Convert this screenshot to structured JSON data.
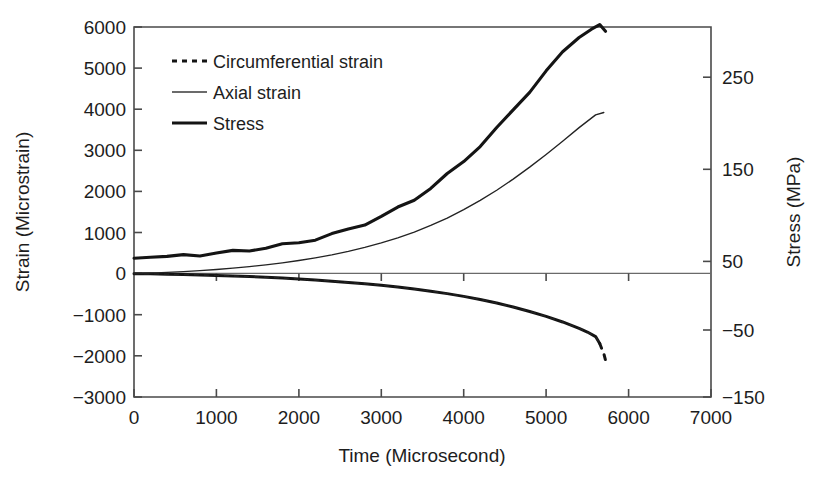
{
  "chart_data": {
    "type": "line",
    "title": "",
    "xlabel": "Time (Microsecond)",
    "ylabel": "Strain (Microstrain)",
    "y2label": "Stress (MPa)",
    "xlim": [
      0,
      7000
    ],
    "ylim": [
      -3000,
      6000
    ],
    "y2lim": [
      -150,
      250
    ],
    "grid": false,
    "legend_position": "top-left inside axes",
    "x_ticks": [
      0,
      1000,
      2000,
      3000,
      4000,
      5000,
      6000,
      7000
    ],
    "x_tick_labels": [
      "0",
      "1000",
      "2000",
      "3000",
      "4000",
      "5000",
      "6000",
      "7000"
    ],
    "y_ticks": [
      -3000,
      -2000,
      -1000,
      0,
      1000,
      2000,
      3000,
      4000,
      5000,
      6000
    ],
    "y_tick_labels": [
      "−3000",
      "−2000",
      "−1000",
      "0",
      "1000",
      "2000",
      "3000",
      "4000",
      "5000",
      "6000"
    ],
    "y2_ticks": [
      -150,
      -50,
      50,
      150,
      250
    ],
    "y2_tick_labels": [
      "−150",
      "−50",
      "50",
      "150",
      "250"
    ],
    "series": [
      {
        "name": "Circumferential strain",
        "style": "dotted",
        "axis": "left",
        "x": [
          0,
          200,
          400,
          600,
          800,
          1000,
          1200,
          1400,
          1600,
          1800,
          2000,
          2200,
          2400,
          2600,
          2800,
          3000,
          3200,
          3400,
          3600,
          3800,
          4000,
          4200,
          4400,
          4600,
          4800,
          5000,
          5200,
          5400,
          5500,
          5600,
          5650,
          5700,
          5720
        ],
        "values": [
          0,
          -5,
          -12,
          -20,
          -30,
          -42,
          -55,
          -70,
          -88,
          -108,
          -130,
          -155,
          -182,
          -212,
          -245,
          -282,
          -325,
          -372,
          -425,
          -485,
          -552,
          -628,
          -715,
          -812,
          -920,
          -1040,
          -1175,
          -1330,
          -1420,
          -1530,
          -1700,
          -1950,
          -2100
        ]
      },
      {
        "name": "Axial strain",
        "style": "thin-solid",
        "axis": "left",
        "x": [
          0,
          200,
          400,
          600,
          800,
          1000,
          1200,
          1400,
          1600,
          1800,
          2000,
          2200,
          2400,
          2600,
          2800,
          3000,
          3200,
          3400,
          3600,
          3800,
          4000,
          4200,
          4400,
          4600,
          4800,
          5000,
          5200,
          5400,
          5600,
          5700
        ],
        "values": [
          0,
          14,
          30,
          50,
          74,
          102,
          134,
          172,
          215,
          264,
          320,
          385,
          458,
          542,
          638,
          748,
          872,
          1012,
          1172,
          1352,
          1556,
          1782,
          2030,
          2300,
          2592,
          2900,
          3222,
          3552,
          3862,
          3920
        ]
      },
      {
        "name": "Stress",
        "style": "thick-solid",
        "axis": "right",
        "x": [
          0,
          200,
          400,
          600,
          800,
          1000,
          1200,
          1400,
          1600,
          1800,
          2000,
          2200,
          2400,
          2600,
          2800,
          3000,
          3200,
          3400,
          3600,
          3800,
          4000,
          4200,
          4400,
          4600,
          4800,
          5000,
          5200,
          5400,
          5550,
          5650,
          5720
        ],
        "values": [
          0,
          1,
          2,
          3,
          4,
          5.5,
          7,
          9,
          11.5,
          14,
          17,
          21,
          25.5,
          31,
          37.5,
          45,
          54,
          64,
          76,
          90,
          105,
          122,
          140,
          160,
          181,
          202,
          222,
          240,
          248,
          251,
          246
        ]
      }
    ],
    "legend_entries": [
      {
        "label": "Circumferential strain",
        "style": "dotted"
      },
      {
        "label": "Axial strain",
        "style": "thin-solid"
      },
      {
        "label": "Stress",
        "style": "thick-solid"
      }
    ]
  }
}
